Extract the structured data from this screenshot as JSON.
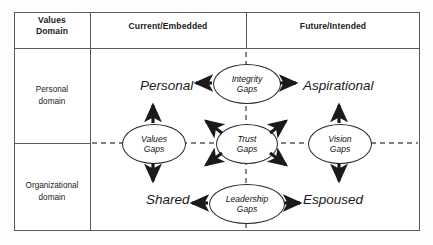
{
  "figure": {
    "type": "2x2 matrix diagram"
  },
  "table": {
    "corner_header": "Values\nDomain",
    "corner_header_line1": "Values",
    "corner_header_line2": "Domain",
    "column_headers": [
      {
        "label": "Current/Embedded"
      },
      {
        "label": "Future/Intended"
      }
    ],
    "row_headers": [
      {
        "line1": "Personal",
        "line2": "domain"
      },
      {
        "line1": "Organizational",
        "line2": "domain"
      }
    ]
  },
  "quadrants": [
    {
      "id": "top-left",
      "label": "Personal",
      "row": "Personal domain",
      "column": "Current/Embedded"
    },
    {
      "id": "top-right",
      "label": "Aspirational",
      "row": "Personal domain",
      "column": "Future/Intended"
    },
    {
      "id": "bottom-left",
      "label": "Shared",
      "row": "Organizational domain",
      "column": "Current/Embedded"
    },
    {
      "id": "bottom-right",
      "label": "Espoused",
      "row": "Organizational domain",
      "column": "Future/Intended"
    }
  ],
  "nodes": [
    {
      "id": "integrity",
      "line1": "Integrity",
      "line2": "Gaps",
      "position": "top-center",
      "connects": [
        "Personal",
        "Aspirational"
      ]
    },
    {
      "id": "values",
      "line1": "Values",
      "line2": "Gaps",
      "position": "middle-left",
      "connects": [
        "Personal",
        "Shared"
      ]
    },
    {
      "id": "trust",
      "line1": "Trust",
      "line2": "Gaps",
      "position": "center",
      "connects": [
        "Personal",
        "Aspirational",
        "Shared",
        "Espoused"
      ]
    },
    {
      "id": "vision",
      "line1": "Vision",
      "line2": "Gaps",
      "position": "middle-right",
      "connects": [
        "Aspirational",
        "Espoused"
      ]
    },
    {
      "id": "leadership",
      "line1": "Leadership",
      "line2": "Gaps",
      "position": "bottom-center",
      "connects": [
        "Shared",
        "Espoused"
      ]
    }
  ],
  "colors": {
    "frame": "#5a5a5a",
    "node_outline": "#2b2b2b",
    "arrow": "#1a1a1a",
    "dashed_axis": "#555555",
    "text": "#1b1b1b",
    "background": "#ffffff"
  }
}
